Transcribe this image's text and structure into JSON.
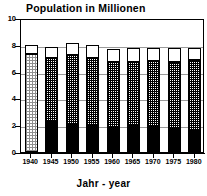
{
  "chart_data": {
    "type": "bar",
    "subtype": "stacked-bar",
    "title": "Population in Millionen",
    "xlabel": "Jahr - year",
    "ylabel": "",
    "ylim": [
      0,
      10
    ],
    "yticks": [
      0,
      2,
      4,
      6,
      8,
      10
    ],
    "ytick_labels": [
      "0",
      "2",
      "4",
      "6",
      "8",
      "10"
    ],
    "grid": true,
    "grid_axis": "y",
    "legend": null,
    "categories": [
      "1940",
      "1945",
      "1950",
      "1955",
      "1960",
      "1965",
      "1970",
      "1975",
      "1980"
    ],
    "series": [
      {
        "name": "lower-segment",
        "fill": "solid-black",
        "color": "#000000",
        "values": [
          0.0,
          2.25,
          2.05,
          1.95,
          1.8,
          1.95,
          1.9,
          1.75,
          1.55
        ]
      },
      {
        "name": "middle-segment",
        "fill": "cross-hatch",
        "color": "#000000",
        "values": [
          7.3,
          4.75,
          5.2,
          5.05,
          4.95,
          4.8,
          4.9,
          5.0,
          5.3
        ]
      },
      {
        "name": "upper-segment",
        "fill": "white",
        "color": "#ffffff",
        "values": [
          0.7,
          0.85,
          0.9,
          0.95,
          0.95,
          1.0,
          1.0,
          1.0,
          0.9
        ]
      }
    ],
    "cumulative_tops": {
      "lower": [
        0.0,
        2.25,
        2.05,
        1.95,
        1.8,
        1.95,
        1.9,
        1.75,
        1.55
      ],
      "middle": [
        7.3,
        7.0,
        7.25,
        7.0,
        6.75,
        6.75,
        6.8,
        6.75,
        6.85
      ],
      "total": [
        8.0,
        7.85,
        8.15,
        7.95,
        7.7,
        7.75,
        7.8,
        7.75,
        7.75
      ]
    },
    "bars": [
      {
        "category": "1940",
        "lower": 0.0,
        "middle_top": 7.3,
        "total": 8.0,
        "mid_pattern": "dot"
      },
      {
        "category": "1945",
        "lower": 2.25,
        "middle_top": 7.0,
        "total": 7.85,
        "mid_pattern": "hatch"
      },
      {
        "category": "1950",
        "lower": 2.05,
        "middle_top": 7.25,
        "total": 8.15,
        "mid_pattern": "hatch"
      },
      {
        "category": "1955",
        "lower": 1.95,
        "middle_top": 7.0,
        "total": 7.95,
        "mid_pattern": "hatch"
      },
      {
        "category": "1960",
        "lower": 1.8,
        "middle_top": 6.75,
        "total": 7.7,
        "mid_pattern": "hatch"
      },
      {
        "category": "1965",
        "lower": 1.95,
        "middle_top": 6.75,
        "total": 7.75,
        "mid_pattern": "hatch"
      },
      {
        "category": "1970",
        "lower": 1.9,
        "middle_top": 6.8,
        "total": 7.8,
        "mid_pattern": "hatch"
      },
      {
        "category": "1975",
        "lower": 1.75,
        "middle_top": 6.75,
        "total": 7.75,
        "mid_pattern": "hatch"
      },
      {
        "category": "1980",
        "lower": 1.55,
        "middle_top": 6.85,
        "total": 7.75,
        "mid_pattern": "hatch"
      }
    ]
  },
  "colors": {
    "axis": "#000000",
    "grid": "#9a9a9a",
    "background": "#ffffff",
    "segment_lower": "#000000",
    "segment_upper": "#ffffff",
    "segment_1940": "#8f8f8f"
  }
}
